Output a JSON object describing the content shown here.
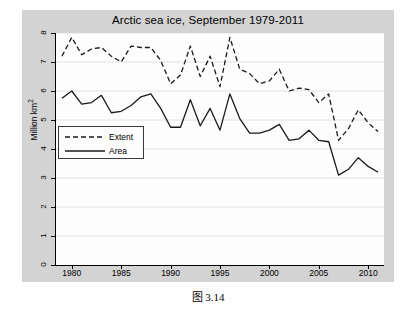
{
  "caption": "图 3.14",
  "chart_data": {
    "type": "line",
    "title": "Arctic sea ice, September 1979-2011",
    "xlabel": "",
    "ylabel": "Million km²",
    "ylabel_text": "Million km",
    "ylabel_superscript": "2",
    "xlim": [
      1978.4,
      2011.6
    ],
    "ylim": [
      0,
      8
    ],
    "yticks": [
      0,
      1,
      2,
      3,
      4,
      5,
      6,
      7,
      8
    ],
    "ytick_labels": [
      "0",
      "1",
      "2",
      "3",
      "4",
      "5",
      "6",
      "7",
      "8"
    ],
    "xticks": [
      1980,
      1985,
      1990,
      1995,
      2000,
      2005,
      2010
    ],
    "xtick_labels": [
      "1980",
      "1985",
      "1990",
      "1995",
      "2000",
      "2005",
      "2010"
    ],
    "grid": "horizontal",
    "legend_position": "left-middle-inside",
    "x": [
      1979,
      1980,
      1981,
      1982,
      1983,
      1984,
      1985,
      1986,
      1987,
      1988,
      1989,
      1990,
      1991,
      1992,
      1993,
      1994,
      1995,
      1996,
      1997,
      1998,
      1999,
      2000,
      2001,
      2002,
      2003,
      2004,
      2005,
      2006,
      2007,
      2008,
      2009,
      2010,
      2011
    ],
    "series": [
      {
        "name": "Extent",
        "style": "dashed",
        "color": "#1a1a1a",
        "values": [
          7.2,
          7.85,
          7.25,
          7.45,
          7.5,
          7.2,
          7.0,
          7.55,
          7.5,
          7.5,
          7.05,
          6.25,
          6.55,
          7.55,
          6.5,
          7.2,
          6.15,
          7.85,
          6.75,
          6.6,
          6.25,
          6.35,
          6.75,
          6.0,
          6.1,
          6.05,
          5.6,
          5.9,
          4.3,
          4.7,
          5.35,
          4.9,
          4.6
        ]
      },
      {
        "name": "Area",
        "style": "solid",
        "color": "#1a1a1a",
        "values": [
          5.75,
          6.0,
          5.55,
          5.6,
          5.85,
          5.25,
          5.3,
          5.5,
          5.8,
          5.9,
          5.4,
          4.75,
          4.75,
          5.7,
          4.8,
          5.4,
          4.65,
          5.9,
          5.05,
          4.55,
          4.55,
          4.65,
          4.85,
          4.3,
          4.35,
          4.65,
          4.3,
          4.25,
          3.1,
          3.3,
          3.7,
          3.4,
          3.2
        ]
      }
    ],
    "legend_entries": [
      {
        "label": "Extent",
        "style": "dashed"
      },
      {
        "label": "Area",
        "style": "solid"
      }
    ]
  }
}
